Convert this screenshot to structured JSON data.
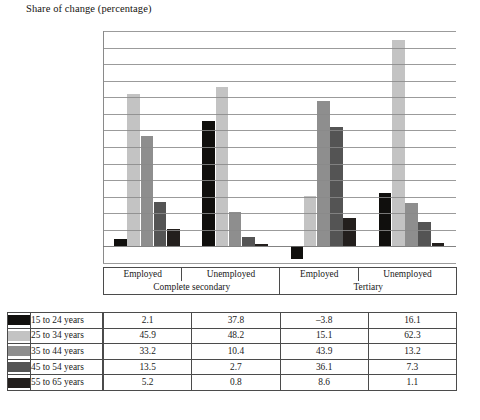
{
  "chart_data": {
    "type": "bar",
    "title": "Share of change (percentage)",
    "xlabel": "",
    "ylabel": "",
    "ylim": [
      -5,
      65
    ],
    "ytick_step": 5,
    "yticks": [
      65,
      60,
      55,
      50,
      45,
      40,
      35,
      30,
      25,
      20,
      15,
      10,
      5,
      0,
      -5
    ],
    "grid": true,
    "legend_position": "table-left-column",
    "categories": [
      "Employed",
      "Unemployed",
      "Employed",
      "Unemployed"
    ],
    "group_labels": [
      "Complete secondary",
      "Tertiary"
    ],
    "series": [
      {
        "name": "15 to 24 years",
        "color": "#100f0d",
        "values": [
          2.1,
          37.8,
          -3.8,
          16.1
        ]
      },
      {
        "name": "25 to 34 years",
        "color": "#c3c3c3",
        "values": [
          45.9,
          48.2,
          15.1,
          62.3
        ]
      },
      {
        "name": "35 to 44 years",
        "color": "#8e8e8e",
        "values": [
          33.2,
          10.4,
          43.9,
          13.2
        ]
      },
      {
        "name": "45 to 54 years",
        "color": "#545454",
        "values": [
          13.5,
          2.7,
          36.1,
          7.3
        ]
      },
      {
        "name": "55 to 65 years",
        "color": "#231f1d",
        "values": [
          5.2,
          0.8,
          8.6,
          1.1
        ]
      }
    ]
  },
  "table": {
    "header_columns": [
      "Employed",
      "Unemployed",
      "Employed",
      "Unemployed"
    ],
    "header_groups": [
      "Complete secondary",
      "Tertiary"
    ],
    "rows": [
      {
        "label": "15 to 24 years",
        "swatch": "#100f0d",
        "values": [
          "2.1",
          "37.8",
          "–3.8",
          "16.1"
        ]
      },
      {
        "label": "25 to 34 years",
        "swatch": "#c3c3c3",
        "values": [
          "45.9",
          "48.2",
          "15.1",
          "62.3"
        ]
      },
      {
        "label": "35 to 44 years",
        "swatch": "#8e8e8e",
        "values": [
          "33.2",
          "10.4",
          "43.9",
          "13.2"
        ]
      },
      {
        "label": "45 to 54 years",
        "swatch": "#545454",
        "values": [
          "13.5",
          "2.7",
          "36.1",
          "7.3"
        ]
      },
      {
        "label": "55 to 65 years",
        "swatch": "#231f1d",
        "values": [
          "5.2",
          "0.8",
          "8.6",
          "1.1"
        ]
      }
    ]
  },
  "footer": {
    "source_text": ""
  }
}
